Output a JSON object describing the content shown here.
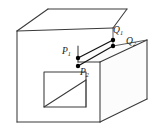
{
  "figure": {
    "background_color": "#ffffff",
    "line_color": "#3a3a3a",
    "connector_color": "#111111",
    "point_color": "#000000",
    "width": 151,
    "height": 135
  },
  "labels": {
    "p1": {
      "base": "P",
      "sub": "1",
      "x": 62,
      "y": 54
    },
    "p2": {
      "base": "P",
      "sub": "2",
      "x": 80,
      "y": 75
    },
    "q1": {
      "base": "Q",
      "sub": "1",
      "x": 113,
      "y": 33
    },
    "q2": {
      "base": "Q",
      "sub": "2",
      "x": 126,
      "y": 44
    }
  },
  "points": [
    {
      "name": "P1",
      "x": 78,
      "y": 58
    },
    {
      "name": "P2",
      "x": 78,
      "y": 66
    },
    {
      "name": "Q1",
      "x": 113,
      "y": 40
    },
    {
      "name": "Q2",
      "x": 113,
      "y": 46
    }
  ],
  "geometry": {
    "top_face": "M 17,31 L 48,9 L 127,9 L 113,28 Z",
    "left_face": "M 17,31 L 17,122 L 100,122 L 100,62 L 78,62 L 78,46 L 113,46 L 113,28 Z",
    "front_right_face": "M 100,62 L 147,40 L 147,99 L 100,122 Z",
    "notch_top": "M 78,46 L 113,46 L 113,28 L 78,46",
    "hole_square": "M 44,72 L 86,72 L 86,107 L 44,107 Z",
    "hole_diagonal": "M 44,107 L 86,80"
  },
  "annotations": {
    "connector_upper": "line from P1 to Q1",
    "connector_lower": "line from P2 to Q2"
  }
}
